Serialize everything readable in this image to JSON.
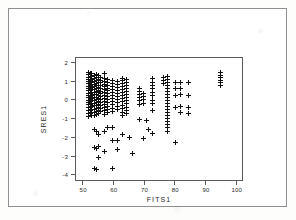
{
  "figure": {
    "background_color": "#ffffff",
    "frame_color": "#8f8f8f",
    "axis_color": "#5a5a5a",
    "marker_color": "#111111",
    "marker_symbol": "plus"
  },
  "chart_data": {
    "type": "scatter",
    "title": "",
    "xlabel": "FITS1",
    "ylabel": "SRES1",
    "xlim": [
      48,
      102
    ],
    "ylim": [
      -4.3,
      2.2
    ],
    "xticks": [
      50,
      60,
      70,
      80,
      90,
      100
    ],
    "xtick_labels": [
      "50",
      "60",
      "70",
      "80",
      "90",
      "100"
    ],
    "yticks": [
      2,
      1,
      0,
      -1,
      -2,
      -3,
      -4
    ],
    "ytick_labels": [
      "2",
      "1",
      "0",
      "-1",
      "-2",
      "-3",
      "-4"
    ],
    "grid": false,
    "legend": null,
    "series": [
      {
        "name": "Standardized residuals vs fitted values",
        "marker": "+",
        "points": [
          [
            52.0,
            1.45
          ],
          [
            52.0,
            1.3
          ],
          [
            52.0,
            1.18
          ],
          [
            52.0,
            1.05
          ],
          [
            52.0,
            0.95
          ],
          [
            52.0,
            0.82
          ],
          [
            52.0,
            0.7
          ],
          [
            52.0,
            0.58
          ],
          [
            52.0,
            0.45
          ],
          [
            52.0,
            0.32
          ],
          [
            52.0,
            0.2
          ],
          [
            52.0,
            0.08
          ],
          [
            52.0,
            -0.05
          ],
          [
            52.0,
            -0.18
          ],
          [
            52.0,
            -0.3
          ],
          [
            52.0,
            -0.45
          ],
          [
            52.0,
            -0.62
          ],
          [
            52.0,
            -0.78
          ],
          [
            52.0,
            -0.92
          ],
          [
            52.6,
            1.35
          ],
          [
            52.6,
            1.2
          ],
          [
            52.6,
            1.02
          ],
          [
            52.6,
            0.88
          ],
          [
            52.6,
            0.74
          ],
          [
            52.6,
            0.6
          ],
          [
            52.6,
            0.46
          ],
          [
            52.6,
            0.3
          ],
          [
            52.6,
            0.15
          ],
          [
            52.6,
            0.0
          ],
          [
            52.6,
            -0.14
          ],
          [
            52.6,
            -0.28
          ],
          [
            52.6,
            -0.44
          ],
          [
            52.6,
            -0.6
          ],
          [
            52.6,
            -0.75
          ],
          [
            53.2,
            1.38
          ],
          [
            53.2,
            1.22
          ],
          [
            53.2,
            1.08
          ],
          [
            53.2,
            0.92
          ],
          [
            53.2,
            0.78
          ],
          [
            53.2,
            0.64
          ],
          [
            53.2,
            0.5
          ],
          [
            53.2,
            0.36
          ],
          [
            53.2,
            0.22
          ],
          [
            53.2,
            0.06
          ],
          [
            53.2,
            -0.08
          ],
          [
            53.2,
            -0.22
          ],
          [
            53.2,
            -0.38
          ],
          [
            53.2,
            -0.55
          ],
          [
            53.2,
            -0.7
          ],
          [
            53.2,
            -0.88
          ],
          [
            53.9,
            1.28
          ],
          [
            53.9,
            1.12
          ],
          [
            53.9,
            0.96
          ],
          [
            53.9,
            0.8
          ],
          [
            53.9,
            0.66
          ],
          [
            53.9,
            0.52
          ],
          [
            53.9,
            0.38
          ],
          [
            53.9,
            0.24
          ],
          [
            53.9,
            0.1
          ],
          [
            53.9,
            -0.04
          ],
          [
            53.9,
            -0.2
          ],
          [
            53.9,
            -0.35
          ],
          [
            53.9,
            -0.52
          ],
          [
            53.9,
            -0.68
          ],
          [
            53.9,
            -0.85
          ],
          [
            53.9,
            -1.6
          ],
          [
            53.9,
            -2.55
          ],
          [
            53.9,
            -3.7
          ],
          [
            54.6,
            1.3
          ],
          [
            54.6,
            1.14
          ],
          [
            54.6,
            1.0
          ],
          [
            54.6,
            0.86
          ],
          [
            54.6,
            0.72
          ],
          [
            54.6,
            0.56
          ],
          [
            54.6,
            0.42
          ],
          [
            54.6,
            0.28
          ],
          [
            54.6,
            0.12
          ],
          [
            54.6,
            -0.02
          ],
          [
            54.6,
            -0.16
          ],
          [
            54.6,
            -0.32
          ],
          [
            54.6,
            -0.48
          ],
          [
            54.6,
            -0.64
          ],
          [
            54.6,
            -0.8
          ],
          [
            54.6,
            -1.7
          ],
          [
            54.6,
            -2.6
          ],
          [
            54.6,
            -3.72
          ],
          [
            55.3,
            1.25
          ],
          [
            55.3,
            1.08
          ],
          [
            55.3,
            0.92
          ],
          [
            55.3,
            0.76
          ],
          [
            55.3,
            0.62
          ],
          [
            55.3,
            0.48
          ],
          [
            55.3,
            0.34
          ],
          [
            55.3,
            0.18
          ],
          [
            55.3,
            0.04
          ],
          [
            55.3,
            -0.1
          ],
          [
            55.3,
            -0.26
          ],
          [
            55.3,
            -0.42
          ],
          [
            55.3,
            -0.58
          ],
          [
            55.3,
            -0.74
          ],
          [
            55.3,
            -1.88
          ],
          [
            55.3,
            -2.5
          ],
          [
            55.3,
            -3.12
          ],
          [
            56.0,
            1.18
          ],
          [
            56.0,
            1.02
          ],
          [
            56.0,
            0.88
          ],
          [
            56.0,
            0.72
          ],
          [
            56.0,
            0.58
          ],
          [
            56.0,
            0.44
          ],
          [
            56.0,
            0.3
          ],
          [
            56.0,
            0.14
          ],
          [
            56.0,
            0.0
          ],
          [
            56.0,
            -0.16
          ],
          [
            56.0,
            -0.34
          ],
          [
            56.0,
            -0.5
          ],
          [
            56.0,
            -0.66
          ],
          [
            57.4,
            1.4
          ],
          [
            57.4,
            1.1
          ],
          [
            57.4,
            0.95
          ],
          [
            57.4,
            0.8
          ],
          [
            57.4,
            0.66
          ],
          [
            57.4,
            0.52
          ],
          [
            57.4,
            0.38
          ],
          [
            57.4,
            0.22
          ],
          [
            57.4,
            0.06
          ],
          [
            57.4,
            -0.1
          ],
          [
            57.4,
            -0.28
          ],
          [
            57.4,
            -0.46
          ],
          [
            57.4,
            -0.62
          ],
          [
            57.4,
            -0.8
          ],
          [
            57.4,
            -1.72
          ],
          [
            57.4,
            -2.78
          ],
          [
            58.2,
            1.05
          ],
          [
            58.2,
            0.9
          ],
          [
            58.2,
            0.76
          ],
          [
            58.2,
            0.6
          ],
          [
            58.2,
            0.46
          ],
          [
            58.2,
            0.32
          ],
          [
            58.2,
            0.16
          ],
          [
            58.2,
            0.0
          ],
          [
            58.2,
            -0.18
          ],
          [
            58.2,
            -0.36
          ],
          [
            58.2,
            -0.54
          ],
          [
            58.2,
            -0.7
          ],
          [
            58.2,
            -1.52
          ],
          [
            60.0,
            1.0
          ],
          [
            60.0,
            0.84
          ],
          [
            60.0,
            0.68
          ],
          [
            60.0,
            0.52
          ],
          [
            60.0,
            0.36
          ],
          [
            60.0,
            0.2
          ],
          [
            60.0,
            0.04
          ],
          [
            60.0,
            -0.12
          ],
          [
            60.0,
            -0.3
          ],
          [
            60.0,
            -0.48
          ],
          [
            60.0,
            -0.64
          ],
          [
            60.0,
            -1.48
          ],
          [
            60.0,
            -2.18
          ],
          [
            60.0,
            -3.68
          ],
          [
            61.5,
            0.96
          ],
          [
            61.5,
            0.8
          ],
          [
            61.5,
            0.64
          ],
          [
            61.5,
            0.48
          ],
          [
            61.5,
            0.32
          ],
          [
            61.5,
            0.16
          ],
          [
            61.5,
            0.0
          ],
          [
            61.5,
            -0.18
          ],
          [
            61.5,
            -0.36
          ],
          [
            61.5,
            -0.56
          ],
          [
            61.5,
            -2.2
          ],
          [
            61.5,
            -2.65
          ],
          [
            63.0,
            1.12
          ],
          [
            63.0,
            0.98
          ],
          [
            63.0,
            0.84
          ],
          [
            63.0,
            0.68
          ],
          [
            63.0,
            0.52
          ],
          [
            63.0,
            0.36
          ],
          [
            63.0,
            0.2
          ],
          [
            63.0,
            0.04
          ],
          [
            63.0,
            -0.14
          ],
          [
            63.0,
            -0.32
          ],
          [
            63.0,
            -0.5
          ],
          [
            63.0,
            -0.68
          ],
          [
            63.0,
            -0.86
          ],
          [
            63.0,
            -1.9
          ],
          [
            64.5,
            1.08
          ],
          [
            64.5,
            0.92
          ],
          [
            64.5,
            0.76
          ],
          [
            64.5,
            0.6
          ],
          [
            64.5,
            0.44
          ],
          [
            64.5,
            0.28
          ],
          [
            64.5,
            0.12
          ],
          [
            64.5,
            -0.06
          ],
          [
            64.5,
            -0.24
          ],
          [
            64.5,
            -0.42
          ],
          [
            64.5,
            -0.6
          ],
          [
            64.5,
            -0.78
          ],
          [
            65.5,
            -2.02
          ],
          [
            66.5,
            -2.9
          ],
          [
            68.5,
            0.6
          ],
          [
            68.5,
            0.42
          ],
          [
            68.5,
            0.26
          ],
          [
            68.5,
            0.1
          ],
          [
            68.5,
            -0.08
          ],
          [
            68.5,
            -0.26
          ],
          [
            68.5,
            -1.06
          ],
          [
            70.0,
            0.3
          ],
          [
            70.0,
            0.14
          ],
          [
            70.0,
            -0.02
          ],
          [
            70.0,
            -0.2
          ],
          [
            70.0,
            -2.08
          ],
          [
            71.0,
            -1.12
          ],
          [
            71.5,
            -1.62
          ],
          [
            73.0,
            1.1
          ],
          [
            73.0,
            0.92
          ],
          [
            73.0,
            0.74
          ],
          [
            73.0,
            0.56
          ],
          [
            73.0,
            0.38
          ],
          [
            73.0,
            0.2
          ],
          [
            73.0,
            -0.04
          ],
          [
            73.0,
            -0.22
          ],
          [
            73.0,
            -0.62
          ],
          [
            73.0,
            -1.82
          ],
          [
            76.5,
            1.18
          ],
          [
            76.5,
            1.0
          ],
          [
            76.5,
            0.84
          ],
          [
            77.8,
            1.24
          ],
          [
            77.8,
            1.08
          ],
          [
            77.8,
            0.92
          ],
          [
            77.8,
            0.76
          ],
          [
            77.8,
            0.6
          ],
          [
            77.8,
            0.44
          ],
          [
            77.8,
            0.28
          ],
          [
            77.8,
            0.12
          ],
          [
            77.8,
            -0.04
          ],
          [
            77.8,
            -0.2
          ],
          [
            77.8,
            -0.36
          ],
          [
            77.8,
            -0.52
          ],
          [
            77.8,
            -0.68
          ],
          [
            77.8,
            -0.84
          ],
          [
            77.8,
            -1.0
          ],
          [
            77.8,
            -1.16
          ],
          [
            77.8,
            -1.32
          ],
          [
            77.8,
            -1.5
          ],
          [
            77.8,
            -1.7
          ],
          [
            80.5,
            0.88
          ],
          [
            80.5,
            0.56
          ],
          [
            80.5,
            0.22
          ],
          [
            80.5,
            -0.42
          ],
          [
            80.5,
            -2.28
          ],
          [
            82.0,
            0.9
          ],
          [
            82.0,
            0.58
          ],
          [
            82.0,
            0.24
          ],
          [
            82.0,
            -0.4
          ],
          [
            82.0,
            -0.72
          ],
          [
            84.5,
            0.92
          ],
          [
            84.5,
            0.2
          ],
          [
            84.5,
            -0.44
          ],
          [
            84.5,
            -0.74
          ],
          [
            95.0,
            1.42
          ],
          [
            95.0,
            1.28
          ],
          [
            95.0,
            1.14
          ],
          [
            95.0,
            1.0
          ],
          [
            95.0,
            0.88
          ],
          [
            95.0,
            0.76
          ]
        ]
      }
    ]
  }
}
